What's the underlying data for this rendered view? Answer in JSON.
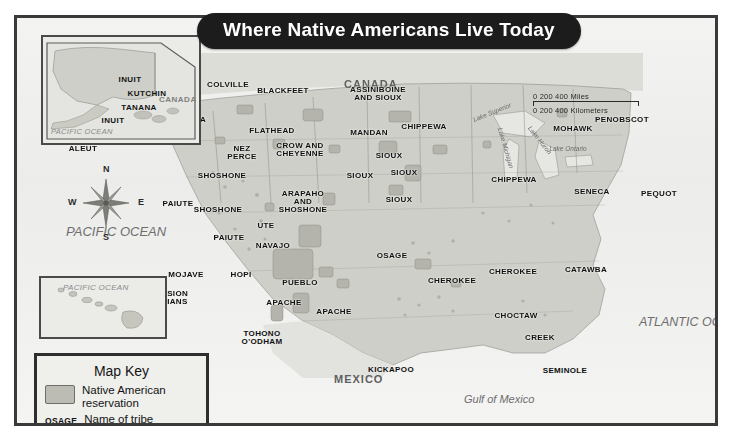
{
  "title": "Where Native Americans Live Today",
  "map_key": {
    "heading": "Map Key",
    "reservation_label": "Native American reservation",
    "tribe_abbr": "OSAGE",
    "tribe_label": "Name of tribe"
  },
  "compass": {
    "north": "N",
    "south": "S",
    "east": "E",
    "west": "W"
  },
  "scales": {
    "main": {
      "miles": "0          200        400 Miles",
      "kilometers": "0      200      400 Kilometers"
    },
    "alaska": {
      "miles": "0    200 Miles",
      "kilometers": "0   200 Kilometers"
    },
    "hawaii": {
      "miles": "0      100 Miles",
      "kilometers": "0   100 Kilometers"
    }
  },
  "regions": {
    "canada": "CANADA",
    "mexico": "MEXICO",
    "pacific_ocean": "PACIFIC OCEAN",
    "atlantic_ocean": "ATLANTIC OCEAN",
    "gulf_of_mexico": "Gulf of Mexico"
  },
  "lakes": [
    {
      "name": "Lake Superior",
      "x": 492,
      "y": 112,
      "rot": -22
    },
    {
      "name": "Lake Michigan",
      "x": 506,
      "y": 148,
      "rot": 74
    },
    {
      "name": "Lake Huron",
      "x": 540,
      "y": 140,
      "rot": 52
    },
    {
      "name": "Lake Ontario",
      "x": 568,
      "y": 148,
      "rot": 0
    }
  ],
  "alaska_inset": {
    "country": "CANADA",
    "ocean": "PACIFIC OCEAN",
    "tribes": [
      {
        "name": "INUIT",
        "x": 87,
        "y": 38
      },
      {
        "name": "KUTCHIN",
        "x": 104,
        "y": 52
      },
      {
        "name": "TANANA",
        "x": 96,
        "y": 66
      },
      {
        "name": "INUIT",
        "x": 70,
        "y": 79
      },
      {
        "name": "ALEUT",
        "x": 40,
        "y": 107
      }
    ]
  },
  "hawaii_inset": {
    "ocean": "PACIFIC OCEAN"
  },
  "tribes": [
    {
      "name": "COLVILLE",
      "x": 228,
      "y": 81
    },
    {
      "name": "BLACKFEET",
      "x": 283,
      "y": 87
    },
    {
      "name": "ASSINIBOINE\nAND SIOUX",
      "x": 378,
      "y": 86
    },
    {
      "name": "YAKAMA",
      "x": 188,
      "y": 116
    },
    {
      "name": "FLATHEAD",
      "x": 272,
      "y": 127
    },
    {
      "name": "MANDAN",
      "x": 369,
      "y": 129
    },
    {
      "name": "CHIPPEWA",
      "x": 424,
      "y": 123
    },
    {
      "name": "MOHAWK",
      "x": 573,
      "y": 125
    },
    {
      "name": "PENOBSCOT",
      "x": 622,
      "y": 116
    },
    {
      "name": "NEZ\nPERCE",
      "x": 242,
      "y": 145
    },
    {
      "name": "CROW AND\nCHEYENNE",
      "x": 300,
      "y": 142
    },
    {
      "name": "SIOUX",
      "x": 389,
      "y": 152
    },
    {
      "name": "SIOUX",
      "x": 360,
      "y": 172
    },
    {
      "name": "SIOUX",
      "x": 404,
      "y": 169
    },
    {
      "name": "CHIPPEWA",
      "x": 514,
      "y": 176
    },
    {
      "name": "SENECA",
      "x": 592,
      "y": 188
    },
    {
      "name": "PEQUOT",
      "x": 659,
      "y": 190
    },
    {
      "name": "SHOSHONE",
      "x": 222,
      "y": 172
    },
    {
      "name": "ARAPAHO\nAND\nSHOSHONE",
      "x": 303,
      "y": 190
    },
    {
      "name": "SIOUX",
      "x": 399,
      "y": 196
    },
    {
      "name": "PAIUTE",
      "x": 178,
      "y": 200
    },
    {
      "name": "SHOSHONE",
      "x": 218,
      "y": 206
    },
    {
      "name": "UTE",
      "x": 266,
      "y": 222
    },
    {
      "name": "PAIUTE",
      "x": 229,
      "y": 234
    },
    {
      "name": "NAVAJO",
      "x": 273,
      "y": 242
    },
    {
      "name": "OSAGE",
      "x": 392,
      "y": 252
    },
    {
      "name": "MOJAVE",
      "x": 186,
      "y": 271
    },
    {
      "name": "HOPI",
      "x": 241,
      "y": 271
    },
    {
      "name": "PUEBLO",
      "x": 300,
      "y": 279
    },
    {
      "name": "CHEROKEE",
      "x": 452,
      "y": 277
    },
    {
      "name": "CHEROKEE",
      "x": 513,
      "y": 268
    },
    {
      "name": "CATAWBA",
      "x": 586,
      "y": 266
    },
    {
      "name": "MISSION\nINDIANS",
      "x": 170,
      "y": 290
    },
    {
      "name": "APACHE",
      "x": 284,
      "y": 299
    },
    {
      "name": "APACHE",
      "x": 334,
      "y": 308
    },
    {
      "name": "CHOCTAW",
      "x": 516,
      "y": 312
    },
    {
      "name": "TOHONO\nO'ODHAM",
      "x": 262,
      "y": 330
    },
    {
      "name": "CREEK",
      "x": 540,
      "y": 334
    },
    {
      "name": "KICKAPOO",
      "x": 391,
      "y": 366
    },
    {
      "name": "SEMINOLE",
      "x": 565,
      "y": 367
    }
  ]
}
